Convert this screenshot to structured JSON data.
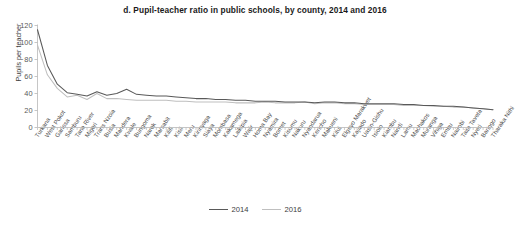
{
  "chart_data": {
    "type": "line",
    "title": "d. Pupil-teacher ratio in public schools, by county, 2014 and 2016",
    "xlabel": "",
    "ylabel": "Pupils per teacher",
    "ylim": [
      0,
      120
    ],
    "yticks": [
      0,
      20,
      40,
      60,
      80,
      100,
      120
    ],
    "grid": false,
    "legend_position": "bottom-center",
    "categories": [
      "Turkana",
      "West Pokot",
      "Garissa",
      "Samburu",
      "Tana River",
      "Migori",
      "Trans Nzoia",
      "Busia",
      "Mandera",
      "Kwale",
      "Bungoma",
      "Narok",
      "Marsabit",
      "Kilifi",
      "Kisii",
      "Meru",
      "Kirinyaga",
      "Siaya",
      "Mombasa",
      "Kakamega",
      "Laikipia",
      "Wajir",
      "Homa Bay",
      "Nyamira",
      "Bomet",
      "Kisumu",
      "Nakuru",
      "Nyandarua",
      "Kericho",
      "Makueni",
      "Kitui",
      "Elgeyo Marakwet",
      "Kajiado",
      "Uasin-Gishu",
      "Isiolo",
      "Kiambu",
      "Nandi",
      "Lamu",
      "Machakos",
      "Muranga",
      "Vihiga",
      "Embu",
      "Nairobi",
      "Taita Taveta",
      "Nyeri",
      "Baringo",
      "Tharaka Nithi"
    ],
    "series": [
      {
        "name": "2014",
        "color": "#595959",
        "values": [
          115,
          73,
          51,
          41,
          39,
          37,
          42,
          38,
          40,
          45,
          39,
          38,
          37,
          37,
          36,
          35,
          34,
          34,
          33,
          33,
          32,
          32,
          31,
          31,
          31,
          30,
          30,
          30,
          29,
          30,
          30,
          29,
          29,
          28,
          28,
          28,
          28,
          27,
          27,
          26,
          26,
          25,
          25,
          24,
          23,
          22,
          21
        ]
      },
      {
        "name": "2016",
        "color": "#bfbfbf",
        "values": [
          97,
          62,
          46,
          36,
          38,
          33,
          40,
          34,
          34,
          33,
          32,
          32,
          32,
          32,
          31,
          31,
          30,
          30,
          30,
          30,
          29,
          29,
          29,
          30,
          29,
          29,
          29,
          30,
          28,
          29,
          29,
          28,
          28,
          27,
          27,
          27,
          27,
          26,
          26,
          26,
          25,
          25,
          24,
          24,
          23,
          22,
          21
        ]
      }
    ]
  },
  "legend": {
    "items": [
      {
        "label": "2014"
      },
      {
        "label": "2016"
      }
    ]
  }
}
